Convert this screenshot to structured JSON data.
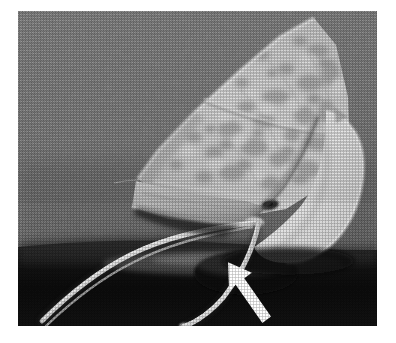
{
  "figure": {
    "domain_kind": "scientific-photograph",
    "medium": "halftone black-and-white printed photograph",
    "alt_text": "Grayscale photograph of a pale mottled skate egg capsule resting on a dark surface against a medium gray background, with two long curving horns extending to the lower left and a white arrow annotation pointing up-left at one horn.",
    "plate": {
      "left": 18,
      "top": 11,
      "width": 359,
      "height": 315,
      "border_color": "#ffffff"
    },
    "palette": {
      "page_background": "#ffffff",
      "photo_background_gray": "#7b7b7b",
      "photo_background_gray_light": "#8a8a8a",
      "photo_background_gray_dark": "#6d6d6d",
      "specimen_highlight": "#ededed",
      "specimen_midtone": "#c8c8c8",
      "specimen_mottle": "#8f8f8f",
      "specimen_shadow": "#6a6a6a",
      "table_shadow_dark": "#101010",
      "table_shadow_black": "#050505",
      "annotation_arrow": "#ffffff"
    },
    "annotations": [
      {
        "name": "arrow-marker",
        "shape": "solid white block arrow",
        "color": "#ffffff",
        "points_to": "lower horn of the egg case",
        "tip_x": 229,
        "tip_y": 263,
        "tail_x": 264,
        "tail_y": 320,
        "direction": "up-left"
      }
    ],
    "features": [
      {
        "name": "egg-capsule-body",
        "description": "broad triangular mottled capsule occupying the upper right of the frame"
      },
      {
        "name": "capsule-seam-ridge",
        "description": "pale diagonal seam running across the capsule face"
      },
      {
        "name": "right-lobe",
        "description": "bright smooth white lobe at the right edge"
      },
      {
        "name": "upper-horn",
        "description": "long slender horn sweeping to the lower left"
      },
      {
        "name": "lower-horn",
        "description": "second horn curving down and left, indicated by the arrow"
      },
      {
        "name": "horn-junction",
        "description": "point where the horns meet the capsule body"
      },
      {
        "name": "cast-shadow",
        "description": "dark shadow band beneath the specimen"
      }
    ]
  }
}
